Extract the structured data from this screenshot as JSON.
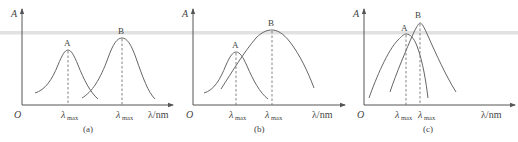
{
  "figure": {
    "axis_y_label": "A",
    "axis_x_label": "λ/nm",
    "origin_label": "O",
    "lambda_max_main": "λ",
    "lambda_max_sub": "max",
    "panels": [
      {
        "id": "a",
        "caption": "(a)",
        "curves": [
          {
            "name": "A",
            "label": "A",
            "peak_order": 1,
            "relative_height": 0.74
          },
          {
            "name": "B",
            "label": "B",
            "peak_order": 2,
            "relative_height": 0.88
          }
        ],
        "relation": "well separated peaks, similar widths"
      },
      {
        "id": "b",
        "caption": "(b)",
        "curves": [
          {
            "name": "A",
            "label": "A",
            "peak_order": 1,
            "relative_height": 0.7
          },
          {
            "name": "B",
            "label": "B",
            "peak_order": 2,
            "relative_height": 0.96
          }
        ],
        "relation": "B broad peak overlapping narrow A peak"
      },
      {
        "id": "c",
        "caption": "(c)",
        "curves": [
          {
            "name": "A",
            "label": "A",
            "peak_order": 1,
            "relative_height": 0.92
          },
          {
            "name": "B",
            "label": "B",
            "peak_order": 2,
            "relative_height": 1.0
          }
        ],
        "relation": "peaks very close, strongly overlapping"
      }
    ]
  }
}
